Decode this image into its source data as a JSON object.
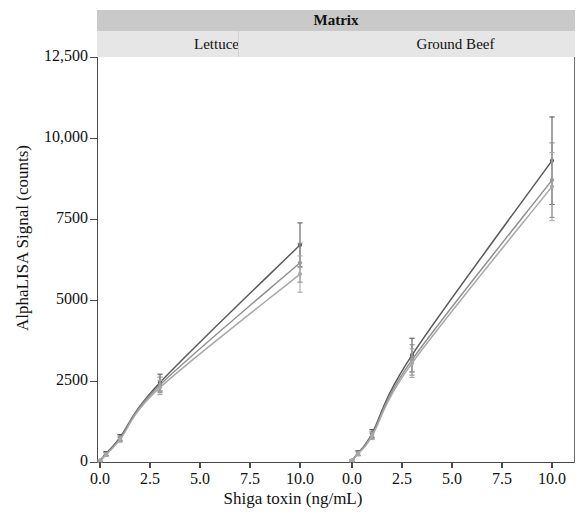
{
  "figure": {
    "strip_title": "Matrix",
    "x_axis_label": "Shiga toxin (ng/mL)",
    "y_axis_label": "AlphaLISA Signal (counts)"
  },
  "chart_data": {
    "type": "line",
    "title": "Matrix",
    "xlabel": "Shiga toxin (ng/mL)",
    "ylabel": "AlphaLISA Signal (counts)",
    "xlim": [
      0,
      10.8
    ],
    "ylim": [
      0,
      12500
    ],
    "grid": false,
    "legend": "none",
    "facet_variable": "Matrix",
    "y_ticks": [
      0,
      2500,
      5000,
      7500,
      10000,
      12500
    ],
    "y_tick_labels": [
      "0",
      "2500",
      "5000",
      "7500",
      "10,000",
      "12,500"
    ],
    "x_ticks": [
      0.0,
      2.5,
      5.0,
      7.5,
      10.0
    ],
    "x_tick_labels": [
      "0.0",
      "2.5",
      "5.0",
      "7.5",
      "10.0"
    ],
    "panels": [
      {
        "name": "Lettuce",
        "series": [
          {
            "name": "replicate-1",
            "color": "#5a5a5a",
            "x": [
              0.0,
              0.3,
              1.0,
              3.0,
              10.0
            ],
            "values": [
              40,
              260,
              760,
              2450,
              6700
            ],
            "err": [
              30,
              60,
              90,
              260,
              680
            ]
          },
          {
            "name": "replicate-2",
            "color": "#8f8f8f",
            "x": [
              0.0,
              0.3,
              1.0,
              3.0,
              10.0
            ],
            "values": [
              35,
              240,
              720,
              2380,
              6150
            ],
            "err": [
              30,
              55,
              85,
              240,
              600
            ]
          },
          {
            "name": "replicate-3",
            "color": "#a8a8a8",
            "x": [
              0.0,
              0.3,
              1.0,
              3.0,
              10.0
            ],
            "values": [
              30,
              225,
              690,
              2300,
              5800
            ],
            "err": [
              28,
              50,
              80,
              220,
              560
            ]
          }
        ]
      },
      {
        "name": "Ground Beef",
        "series": [
          {
            "name": "replicate-1",
            "color": "#5a5a5a",
            "x": [
              0.0,
              0.3,
              1.0,
              3.0,
              10.0
            ],
            "values": [
              45,
              280,
              880,
              3300,
              9300
            ],
            "err": [
              30,
              70,
              120,
              520,
              1350
            ]
          },
          {
            "name": "replicate-2",
            "color": "#8f8f8f",
            "x": [
              0.0,
              0.3,
              1.0,
              3.0,
              10.0
            ],
            "values": [
              40,
              265,
              840,
              3150,
              8700
            ],
            "err": [
              30,
              65,
              110,
              470,
              1150
            ]
          },
          {
            "name": "replicate-3",
            "color": "#a8a8a8",
            "x": [
              0.0,
              0.3,
              1.0,
              3.0,
              10.0
            ],
            "values": [
              35,
              250,
              800,
              3050,
              8500
            ],
            "err": [
              28,
              60,
              105,
              440,
              1050
            ]
          }
        ]
      }
    ]
  }
}
